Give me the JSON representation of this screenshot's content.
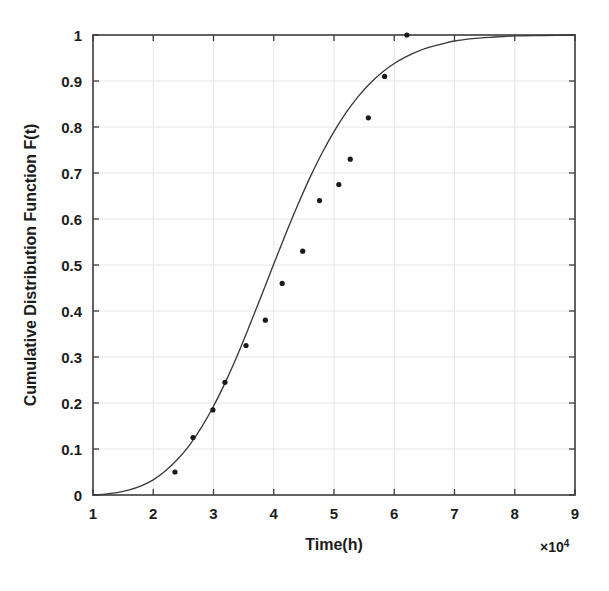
{
  "chart_data": {
    "type": "scatter",
    "title": "",
    "subtitle": "",
    "xlabel": "Time(h)",
    "ylabel": "Cumulative Distribution Function F(t)",
    "x_multiplier_label": "×10",
    "x_multiplier_exponent": "4",
    "x_multiplier_value": 10000,
    "xlim": [
      1,
      9
    ],
    "ylim": [
      0,
      1
    ],
    "grid": true,
    "legend": null,
    "xticks": [
      1,
      2,
      3,
      4,
      5,
      6,
      7,
      8,
      9
    ],
    "xtick_labels": [
      "1",
      "2",
      "3",
      "4",
      "5",
      "6",
      "7",
      "8",
      "9"
    ],
    "yticks": [
      0,
      0.1,
      0.2,
      0.3,
      0.4,
      0.5,
      0.6,
      0.7,
      0.8,
      0.9,
      1
    ],
    "ytick_labels": [
      "0",
      "0.1",
      "0.2",
      "0.3",
      "0.4",
      "0.5",
      "0.6",
      "0.7",
      "0.8",
      "0.9",
      "1"
    ],
    "series": [
      {
        "name": "Empirical CDF data points",
        "type": "scatter",
        "marker": "dot",
        "color": "#1a1a1a",
        "points": [
          {
            "x": 2.36,
            "y": 0.05
          },
          {
            "x": 2.66,
            "y": 0.125
          },
          {
            "x": 2.99,
            "y": 0.185
          },
          {
            "x": 3.19,
            "y": 0.245
          },
          {
            "x": 3.54,
            "y": 0.325
          },
          {
            "x": 3.86,
            "y": 0.38
          },
          {
            "x": 4.14,
            "y": 0.46
          },
          {
            "x": 4.48,
            "y": 0.53
          },
          {
            "x": 4.76,
            "y": 0.64
          },
          {
            "x": 5.08,
            "y": 0.675
          },
          {
            "x": 5.27,
            "y": 0.73
          },
          {
            "x": 5.57,
            "y": 0.82
          },
          {
            "x": 5.84,
            "y": 0.91
          },
          {
            "x": 6.21,
            "y": 1.0
          }
        ]
      },
      {
        "name": "Fitted CDF curve",
        "type": "line",
        "color": "#3a3a3a",
        "points": [
          {
            "x": 1.0,
            "y": 0.0
          },
          {
            "x": 1.2,
            "y": 0.002
          },
          {
            "x": 1.4,
            "y": 0.005
          },
          {
            "x": 1.6,
            "y": 0.011
          },
          {
            "x": 1.8,
            "y": 0.02
          },
          {
            "x": 2.0,
            "y": 0.033
          },
          {
            "x": 2.2,
            "y": 0.052
          },
          {
            "x": 2.4,
            "y": 0.077
          },
          {
            "x": 2.6,
            "y": 0.108
          },
          {
            "x": 2.8,
            "y": 0.147
          },
          {
            "x": 3.0,
            "y": 0.193
          },
          {
            "x": 3.2,
            "y": 0.246
          },
          {
            "x": 3.4,
            "y": 0.305
          },
          {
            "x": 3.6,
            "y": 0.369
          },
          {
            "x": 3.8,
            "y": 0.435
          },
          {
            "x": 4.0,
            "y": 0.502
          },
          {
            "x": 4.2,
            "y": 0.568
          },
          {
            "x": 4.4,
            "y": 0.631
          },
          {
            "x": 4.6,
            "y": 0.69
          },
          {
            "x": 4.8,
            "y": 0.743
          },
          {
            "x": 5.0,
            "y": 0.79
          },
          {
            "x": 5.2,
            "y": 0.831
          },
          {
            "x": 5.4,
            "y": 0.866
          },
          {
            "x": 5.6,
            "y": 0.895
          },
          {
            "x": 5.8,
            "y": 0.919
          },
          {
            "x": 6.0,
            "y": 0.938
          },
          {
            "x": 6.2,
            "y": 0.953
          },
          {
            "x": 6.4,
            "y": 0.965
          },
          {
            "x": 6.6,
            "y": 0.974
          },
          {
            "x": 6.8,
            "y": 0.981
          },
          {
            "x": 7.0,
            "y": 0.987
          },
          {
            "x": 7.3,
            "y": 0.992
          },
          {
            "x": 7.6,
            "y": 0.995
          },
          {
            "x": 8.0,
            "y": 0.998
          },
          {
            "x": 8.5,
            "y": 0.999
          },
          {
            "x": 9.0,
            "y": 1.0
          }
        ]
      }
    ]
  },
  "colors": {
    "axis": "#3c3c3c",
    "grid": "#e6e6e6",
    "marker": "#1a1a1a",
    "curve": "#474747",
    "background": "#ffffff"
  }
}
